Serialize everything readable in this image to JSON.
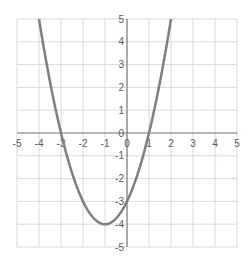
{
  "chart_data": {
    "type": "line",
    "title": "",
    "xlabel": "",
    "ylabel": "",
    "xlim": [
      -5,
      5
    ],
    "ylim": [
      -5,
      5
    ],
    "grid": true,
    "legend": null,
    "x_ticks": [
      -5,
      -4,
      -3,
      -2,
      -1,
      0,
      1,
      2,
      3,
      4,
      5
    ],
    "y_ticks": [
      -5,
      -4,
      -3,
      -2,
      -1,
      0,
      1,
      2,
      3,
      4,
      5
    ],
    "series": [
      {
        "name": "y = x^2 + 2x - 3",
        "color": "#7f7f7f",
        "x": [
          -4,
          -3.5,
          -3,
          -2.5,
          -2,
          -1.5,
          -1,
          -0.5,
          0,
          0.5,
          1,
          1.5,
          2
        ],
        "y": [
          5,
          2.25,
          0,
          -1.75,
          -3,
          -3.75,
          -4,
          -3.75,
          -3,
          -1.75,
          0,
          2.25,
          5
        ]
      }
    ],
    "annotations": {
      "vertex": [
        -1,
        -4
      ],
      "roots": [
        -3,
        1
      ],
      "y_intercept": -3
    }
  },
  "style": {
    "grid_color": "#d9d9d9",
    "axis_color": "#808080",
    "curve_color": "#7f7f7f",
    "label_color": "#595959"
  }
}
